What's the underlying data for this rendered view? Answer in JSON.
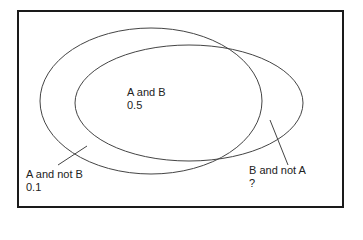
{
  "diagram": {
    "type": "venn",
    "frame": {
      "x": 18,
      "y": 11,
      "width": 325,
      "height": 196,
      "stroke": "#1a1a1a"
    },
    "sets": [
      {
        "name": "A",
        "cx": 151,
        "cy": 101,
        "rx": 111,
        "ry": 73,
        "stroke": "#444444"
      },
      {
        "name": "B",
        "cx": 189,
        "cy": 103,
        "rx": 114,
        "ry": 58,
        "stroke": "#444444"
      }
    ],
    "regions": {
      "a_and_b": {
        "title": "A and B",
        "value": "0.5"
      },
      "a_not_b": {
        "title": "A and not B",
        "value": "0.1"
      },
      "b_not_a": {
        "title": "B and not A",
        "value": "?"
      }
    },
    "pointers": [
      {
        "target": "a_not_b",
        "x1": 58,
        "y1": 165,
        "x2": 87,
        "y2": 146
      },
      {
        "target": "b_not_a",
        "x1": 270,
        "y1": 120,
        "x2": 288,
        "y2": 165
      }
    ]
  }
}
